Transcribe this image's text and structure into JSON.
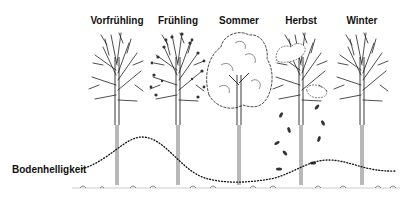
{
  "diagram": {
    "seasons": [
      {
        "label": "Vorfrühling",
        "state": "bare-branches",
        "x": 117
      },
      {
        "label": "Frühling",
        "state": "budding-leaves",
        "x": 178
      },
      {
        "label": "Sommer",
        "state": "full-canopy",
        "x": 239
      },
      {
        "label": "Herbst",
        "state": "falling-leaves",
        "x": 301
      },
      {
        "label": "Winter",
        "state": "bare-branches",
        "x": 362
      }
    ],
    "curve_label": "Bodenhelligkeit",
    "colors": {
      "ink": "#111111",
      "background": "#ffffff"
    }
  }
}
